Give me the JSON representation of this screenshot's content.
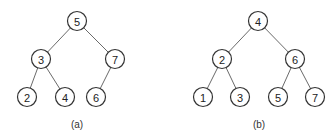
{
  "diagrams": [
    {
      "caption": "(a)",
      "caption_pos": [
        77,
        125
      ],
      "nodes": [
        {
          "id": "a5",
          "label": "5",
          "x": 77,
          "y": 21
        },
        {
          "id": "a3",
          "label": "3",
          "x": 41,
          "y": 59
        },
        {
          "id": "a7",
          "label": "7",
          "x": 115,
          "y": 59
        },
        {
          "id": "a2",
          "label": "2",
          "x": 27,
          "y": 97
        },
        {
          "id": "a4",
          "label": "4",
          "x": 65,
          "y": 97
        },
        {
          "id": "a6",
          "label": "6",
          "x": 96,
          "y": 97
        }
      ],
      "edges": [
        [
          "a5",
          "a3"
        ],
        [
          "a5",
          "a7"
        ],
        [
          "a3",
          "a2"
        ],
        [
          "a3",
          "a4"
        ],
        [
          "a7",
          "a6"
        ]
      ]
    },
    {
      "caption": "(b)",
      "caption_pos": [
        259,
        125
      ],
      "nodes": [
        {
          "id": "b4",
          "label": "4",
          "x": 258,
          "y": 21
        },
        {
          "id": "b2",
          "label": "2",
          "x": 222,
          "y": 59
        },
        {
          "id": "b6",
          "label": "6",
          "x": 295,
          "y": 59
        },
        {
          "id": "b1",
          "label": "1",
          "x": 203,
          "y": 97
        },
        {
          "id": "b3",
          "label": "3",
          "x": 240,
          "y": 97
        },
        {
          "id": "b5",
          "label": "5",
          "x": 278,
          "y": 97
        },
        {
          "id": "b7",
          "label": "7",
          "x": 315,
          "y": 97
        }
      ],
      "edges": [
        [
          "b4",
          "b2"
        ],
        [
          "b4",
          "b6"
        ],
        [
          "b2",
          "b1"
        ],
        [
          "b2",
          "b3"
        ],
        [
          "b6",
          "b5"
        ],
        [
          "b6",
          "b7"
        ]
      ]
    }
  ],
  "node_radius": 9.5
}
